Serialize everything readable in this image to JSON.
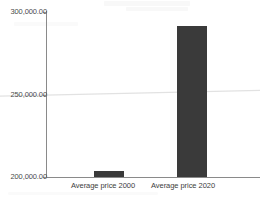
{
  "chart_data": {
    "type": "bar",
    "title": "",
    "subtitle": "",
    "xlabel": "",
    "ylabel": "",
    "categories": [
      "Average price 2000",
      "Average price 2020"
    ],
    "values": [
      203600,
      291500
    ],
    "value_labels": [
      "",
      ""
    ],
    "ylim": [
      200000,
      300000
    ],
    "y_ticks": [
      200000,
      250000,
      300000
    ],
    "y_tick_labels": [
      "200,000.00",
      "250,000.00",
      "300,000.00"
    ],
    "grid": false,
    "legend": false,
    "legend_position": "none",
    "bar_color": "#3a3a3a",
    "axis_color": "#8a8a8a",
    "text_color": "#3d3d3d",
    "background": "#ffffff",
    "series": [
      {
        "name": "Average price",
        "values": [
          203600,
          291500
        ]
      }
    ],
    "annotations": [
      {
        "name": "trendline",
        "type": "line",
        "color": "#e2e2e2",
        "x_start": 0,
        "x_end": 260,
        "y_value_start": 249000,
        "y_value_end": 252500
      }
    ]
  },
  "axis": {
    "y_top_label": "300,000.00",
    "y_mid_label": "250,000.00",
    "y_bottom_label": "200,000.00"
  },
  "categories": {
    "first": "Average price 2000",
    "second": "Average price 2020"
  }
}
